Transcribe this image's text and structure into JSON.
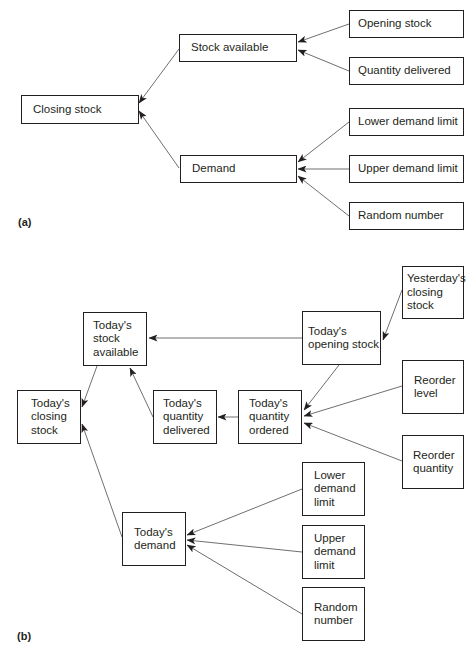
{
  "diagram": {
    "panels": [
      {
        "id": "a",
        "label": "(a)",
        "label_pos": [
          18,
          216
        ],
        "nodes": [
          {
            "id": "a_closing",
            "text": "Closing stock",
            "box": [
              21,
              95,
              118,
              29
            ],
            "style": "single"
          },
          {
            "id": "a_stock_avail",
            "text": "Stock available",
            "box": [
              179,
              34,
              118,
              28
            ],
            "style": "single"
          },
          {
            "id": "a_demand",
            "text": "Demand",
            "box": [
              180,
              155,
              117,
              28
            ],
            "style": "single"
          },
          {
            "id": "a_opening",
            "text": "Opening stock",
            "box": [
              349,
              10,
              115,
              28
            ],
            "style": "single",
            "pad": 8
          },
          {
            "id": "a_qty_deliv",
            "text": "Quantity delivered",
            "box": [
              349,
              57,
              115,
              28
            ],
            "style": "single",
            "pad": 8
          },
          {
            "id": "a_lower",
            "text": "Lower demand limit",
            "box": [
              349,
              108,
              115,
              28
            ],
            "style": "single",
            "pad": 8
          },
          {
            "id": "a_upper",
            "text": "Upper demand limit",
            "box": [
              349,
              155,
              115,
              28
            ],
            "style": "single",
            "pad": 8
          },
          {
            "id": "a_random",
            "text": "Random number",
            "box": [
              349,
              202,
              115,
              28
            ],
            "style": "single",
            "pad": 8
          }
        ],
        "edges": [
          {
            "from": "Stock available",
            "to": "Closing stock",
            "points": [
              179,
              49,
              139,
              103
            ]
          },
          {
            "from": "Demand",
            "to": "Closing stock",
            "points": [
              179,
              168,
              139,
              111
            ]
          },
          {
            "from": "Opening stock",
            "to": "Stock available",
            "points": [
              349,
              24,
              298,
              42
            ]
          },
          {
            "from": "Quantity delivered",
            "to": "Stock available",
            "points": [
              349,
              71,
              298,
              50
            ]
          },
          {
            "from": "Lower demand limit",
            "to": "Demand",
            "points": [
              349,
              122,
              298,
              162
            ]
          },
          {
            "from": "Upper demand limit",
            "to": "Demand",
            "points": [
              349,
              169,
              298,
              169
            ]
          },
          {
            "from": "Random number",
            "to": "Demand",
            "points": [
              349,
              216,
              298,
              176
            ]
          }
        ]
      },
      {
        "id": "b",
        "label": "(b)",
        "label_pos": [
          17,
          630
        ],
        "nodes": [
          {
            "id": "b_closing",
            "text": "Today's\nclosing\nstock",
            "box": [
              17,
              390,
              64,
              54
            ],
            "style": "multi",
            "pad": 13
          },
          {
            "id": "b_stock_avail",
            "text": "Today's\nstock\navailable",
            "box": [
              83,
              312,
              64,
              54
            ],
            "style": "multi",
            "pad": 9
          },
          {
            "id": "b_qty_deliv",
            "text": "Today's\nquantity\ndelivered",
            "box": [
              153,
              390,
              64,
              54
            ],
            "style": "multi",
            "pad": 9
          },
          {
            "id": "b_qty_ordered",
            "text": "Today's\nquantity\nordered",
            "box": [
              238,
              390,
              64,
              54
            ],
            "style": "multi",
            "pad": 10
          },
          {
            "id": "b_opening",
            "text": "Today's\nopening stock",
            "box": [
              302,
              311,
              79,
              54
            ],
            "style": "multi",
            "pad": 5
          },
          {
            "id": "b_yest_closing",
            "text": "Yesterday's\nclosing\nstock",
            "box": [
              402,
              266,
              62,
              53
            ],
            "style": "multi",
            "pad": 4
          },
          {
            "id": "b_reorder_level",
            "text": "Reorder\nlevel",
            "box": [
              402,
              360,
              62,
              54
            ],
            "style": "multi",
            "pad": 11
          },
          {
            "id": "b_reorder_qty",
            "text": "Reorder\nquantity",
            "box": [
              402,
              435,
              62,
              54
            ],
            "style": "multi",
            "pad": 10
          },
          {
            "id": "b_demand",
            "text": "Today's\ndemand",
            "box": [
              122,
              512,
              64,
              54
            ],
            "style": "multi",
            "pad": 11
          },
          {
            "id": "b_lower",
            "text": "Lower\ndemand\nlimit",
            "box": [
              302,
              462,
              63,
              54
            ],
            "style": "multi",
            "pad": 11
          },
          {
            "id": "b_upper",
            "text": "Upper\ndemand\nlimit",
            "box": [
              302,
              525,
              63,
              54
            ],
            "style": "multi",
            "pad": 11
          },
          {
            "id": "b_random",
            "text": "Random\nnumber",
            "box": [
              302,
              587,
              63,
              54
            ],
            "style": "multi",
            "pad": 11
          }
        ],
        "edges": [
          {
            "from": "Today's stock available",
            "to": "Today's closing stock",
            "points": [
              97,
              366,
              82,
              407
            ]
          },
          {
            "from": "Today's demand",
            "to": "Today's closing stock",
            "points": [
              122,
              537,
              82,
              424
            ]
          },
          {
            "from": "Today's quantity delivered",
            "to": "Today's stock available",
            "points": [
              153,
              417,
              130,
              368
            ]
          },
          {
            "from": "Today's opening stock",
            "to": "Today's stock available",
            "points": [
              302,
              338,
              149,
              338
            ]
          },
          {
            "from": "Today's quantity ordered",
            "to": "Today's quantity delivered",
            "points": [
              238,
              417,
              218,
              417
            ]
          },
          {
            "from": "Yesterday's closing stock",
            "to": "Today's opening stock",
            "points": [
              402,
              290,
              383,
              340
            ]
          },
          {
            "from": "Today's opening stock",
            "to": "Today's quantity ordered",
            "points": [
              339,
              365,
              304,
              410
            ]
          },
          {
            "from": "Reorder level",
            "to": "Today's quantity ordered",
            "points": [
              402,
              386,
              304,
              416
            ]
          },
          {
            "from": "Reorder quantity",
            "to": "Today's quantity ordered",
            "points": [
              402,
              461,
              304,
              423
            ]
          },
          {
            "from": "Lower demand limit",
            "to": "Today's demand",
            "points": [
              302,
              489,
              187,
              535
            ]
          },
          {
            "from": "Upper demand limit",
            "to": "Today's demand",
            "points": [
              302,
              552,
              187,
              540
            ]
          },
          {
            "from": "Random number",
            "to": "Today's demand",
            "points": [
              302,
              614,
              187,
              545
            ]
          }
        ]
      }
    ]
  }
}
